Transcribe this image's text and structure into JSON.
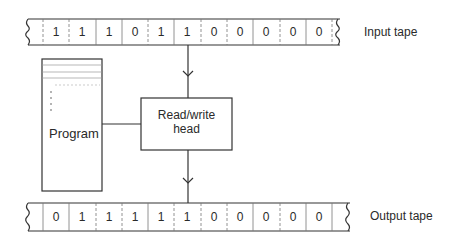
{
  "diagram": {
    "input_tape": {
      "label": "Input tape",
      "cells": [
        "1",
        "1",
        "1",
        "0",
        "1",
        "1",
        "0",
        "0",
        "0",
        "0",
        "0"
      ],
      "head_position_index": 5
    },
    "output_tape": {
      "label": "Output tape",
      "cells": [
        "0",
        "1",
        "1",
        "1",
        "1",
        "1",
        "0",
        "0",
        "0",
        "0",
        "0"
      ],
      "head_position_index": 5
    },
    "program": {
      "label": "Program"
    },
    "head": {
      "line1": "Read/write",
      "line2": "head"
    },
    "colors": {
      "stroke": "#333333",
      "divider": "#888888",
      "background": "#ffffff"
    }
  }
}
